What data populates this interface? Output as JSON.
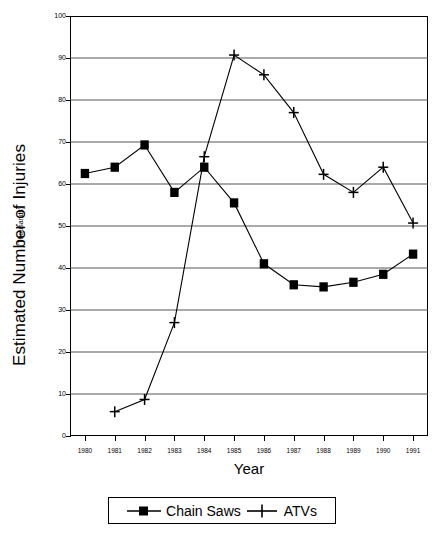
{
  "chart_data": {
    "type": "line",
    "title": "",
    "xlabel": "Year",
    "ylabel": "Estimated Number of Injuries",
    "ylabel_sub": "(Thousands)",
    "categories": [
      "1980",
      "1981",
      "1982",
      "1983",
      "1984",
      "1985",
      "1986",
      "1987",
      "1988",
      "1989",
      "1990",
      "1991"
    ],
    "ylim": [
      0,
      100
    ],
    "yticks": [
      0,
      10,
      20,
      30,
      40,
      50,
      60,
      70,
      80,
      90,
      100
    ],
    "ytick_labels": [
      "0",
      "10",
      "20",
      "30",
      "40",
      "50",
      "60",
      "70",
      "80",
      "90",
      "100"
    ],
    "grid": "horizontal",
    "legend_position": "bottom",
    "series": [
      {
        "name": "Chain Saws",
        "marker": "filled-square",
        "values": [
          62.5,
          64.0,
          69.3,
          58.0,
          64.0,
          55.5,
          41.0,
          36.0,
          35.5,
          36.6,
          38.5,
          43.3
        ]
      },
      {
        "name": "ATVs",
        "marker": "plus",
        "values": [
          null,
          5.8,
          8.7,
          27.0,
          66.5,
          90.7,
          86.0,
          77.0,
          62.3,
          58.0,
          64.0,
          50.7
        ]
      }
    ]
  },
  "legend": {
    "items": [
      {
        "label": "Chain Saws"
      },
      {
        "label": "ATVs"
      }
    ]
  },
  "axes": {
    "x_title": "Year",
    "y_title": "Estimated Number of Injuries",
    "y_subtitle": "(Thousands)"
  },
  "colors": {
    "line": "#000000",
    "grid": "#555555",
    "background": "#ffffff"
  }
}
